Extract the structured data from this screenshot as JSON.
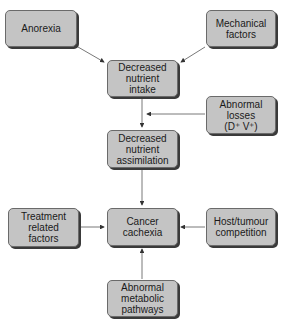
{
  "diagram": {
    "nodes": [
      {
        "id": "anorexia",
        "label": "Anorexia"
      },
      {
        "id": "mechanical",
        "label": "Mechanical\nfactors"
      },
      {
        "id": "intake",
        "label": "Decreased\nnutrient\nintake"
      },
      {
        "id": "losses",
        "label": "Abnormal\nlosses\n(D⁺ V⁺)"
      },
      {
        "id": "assimilation",
        "label": "Decreased\nnutrient\nassimilation"
      },
      {
        "id": "treatment",
        "label": "Treatment\nrelated\nfactors"
      },
      {
        "id": "cachexia",
        "label": "Cancer\ncachexia"
      },
      {
        "id": "host",
        "label": "Host/tumour\ncompetition"
      },
      {
        "id": "metabolic",
        "label": "Abnormal\nmetabolic\npathways"
      }
    ],
    "edges": [
      {
        "from": "anorexia",
        "to": "intake"
      },
      {
        "from": "mechanical",
        "to": "intake"
      },
      {
        "from": "intake",
        "to": "assimilation"
      },
      {
        "from": "losses",
        "to": "intake-assimilation-link"
      },
      {
        "from": "assimilation",
        "to": "cachexia"
      },
      {
        "from": "treatment",
        "to": "cachexia"
      },
      {
        "from": "host",
        "to": "cachexia"
      },
      {
        "from": "metabolic",
        "to": "cachexia"
      }
    ],
    "colors": {
      "box_fill": "#c4c4c4",
      "box_border": "#6a6a6a",
      "shadow": "#3a3a3a",
      "line": "#444444"
    }
  }
}
